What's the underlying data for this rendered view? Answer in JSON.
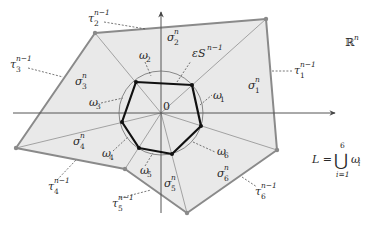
{
  "diagram": {
    "space_label": {
      "base": "ℝ",
      "sup": "n"
    },
    "origin_label": "0",
    "sphere_label": {
      "prefix": "ε",
      "base": "S",
      "sup": "n−1"
    },
    "cones": [
      {
        "base": "σ",
        "sub": "1",
        "sup": "n"
      },
      {
        "base": "σ",
        "sub": "2",
        "sup": "n"
      },
      {
        "base": "σ",
        "sub": "3",
        "sup": "n"
      },
      {
        "base": "σ",
        "sub": "4",
        "sup": "n"
      },
      {
        "base": "σ",
        "sub": "5",
        "sup": "n"
      },
      {
        "base": "σ",
        "sub": "6",
        "sup": "n"
      }
    ],
    "facets": [
      {
        "base": "τ",
        "sub": "1",
        "sup": "n−1"
      },
      {
        "base": "τ",
        "sub": "2",
        "sup": "n−1"
      },
      {
        "base": "τ",
        "sub": "3",
        "sup": "n−1"
      },
      {
        "base": "τ",
        "sub": "4",
        "sup": "n−1"
      },
      {
        "base": "τ",
        "sub": "5",
        "sup": "n−1"
      },
      {
        "base": "τ",
        "sub": "6",
        "sup": "n−1"
      }
    ],
    "arcs": [
      {
        "base": "ω",
        "sub": "1"
      },
      {
        "base": "ω",
        "sub": "2"
      },
      {
        "base": "ω",
        "sub": "3"
      },
      {
        "base": "ω",
        "sub": "4"
      },
      {
        "base": "ω",
        "sub": "5"
      },
      {
        "base": "ω",
        "sub": "6"
      }
    ],
    "union_formula": {
      "lhs": "L =",
      "operator": "⋃",
      "upper": "6",
      "lower": "i=1",
      "term_base": "ω",
      "term_sub": "i"
    }
  },
  "colors": {
    "region_fill": "#e9e9e9",
    "outer_boundary": "#8a8a8a",
    "link_polygon": "#111111",
    "sphere": "#6d6d6d",
    "axes": "#555555"
  }
}
